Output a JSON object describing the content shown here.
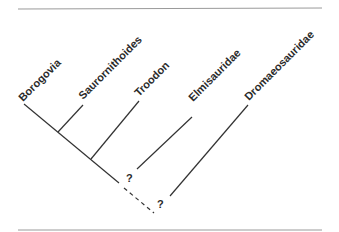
{
  "diagram": {
    "type": "cladogram",
    "taxa": [
      {
        "label": "Borogovia"
      },
      {
        "label": "Saurornithoides"
      },
      {
        "label": "Troodon"
      },
      {
        "label": "Elmisauridae"
      },
      {
        "label": "Dromaeosauridae"
      }
    ],
    "uncertain_markers": [
      {
        "label": "?"
      },
      {
        "label": "?"
      }
    ],
    "colors": {
      "line": "#333333",
      "rule": "#9a9a9a",
      "background": "#ffffff"
    }
  }
}
